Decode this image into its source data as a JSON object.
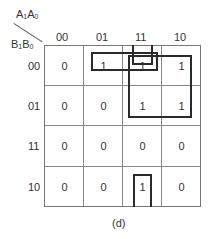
{
  "variables": {
    "column_var": {
      "main": "A",
      "sub1": "1",
      "main2": "A",
      "sub2": "0"
    },
    "row_var": {
      "main": "B",
      "sub1": "1",
      "main2": "B",
      "sub2": "0"
    }
  },
  "columns": [
    "00",
    "01",
    "11",
    "10"
  ],
  "rows": [
    {
      "label": "00",
      "cells": [
        "0",
        "1",
        "1",
        "1"
      ]
    },
    {
      "label": "01",
      "cells": [
        "0",
        "0",
        "1",
        "1"
      ]
    },
    {
      "label": "11",
      "cells": [
        "0",
        "0",
        "0",
        "0"
      ]
    },
    {
      "label": "10",
      "cells": [
        "0",
        "0",
        "1",
        "0"
      ]
    }
  ],
  "groupings": [
    {
      "name": "pair-row00-cols01-11",
      "cells": [
        "00/01",
        "00/11"
      ]
    },
    {
      "name": "single-row00-col11-wrap",
      "cells": [
        "00/11"
      ],
      "wraps": "top"
    },
    {
      "name": "quad-rows00-01-cols11-10",
      "cells": [
        "00/11",
        "00/10",
        "01/11",
        "01/10"
      ]
    },
    {
      "name": "single-row10-col11-wrap",
      "cells": [
        "10/11"
      ],
      "wraps": "bottom"
    }
  ],
  "caption": "(d)"
}
